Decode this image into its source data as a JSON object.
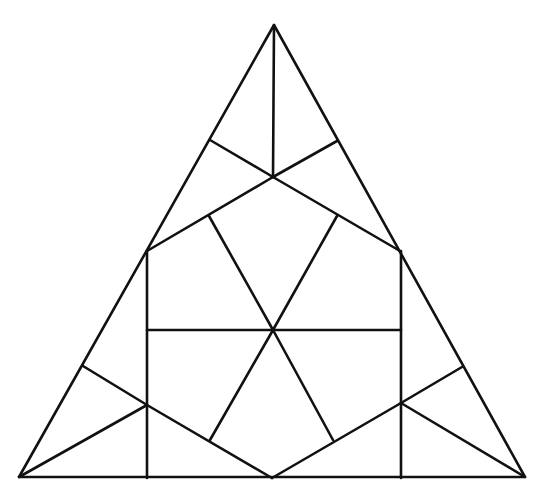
{
  "figure": {
    "stroke_color": "#111111",
    "background": "#ffffff",
    "stroke_width": 2.6,
    "outer_triangle": [
      [
        274,
        25
      ],
      [
        19,
        477
      ],
      [
        525,
        477
      ]
    ],
    "segments": [
      [
        274,
        25,
        273,
        177
      ],
      [
        210,
        140,
        273,
        177
      ],
      [
        337,
        141,
        273,
        177
      ],
      [
        273,
        177,
        147,
        251
      ],
      [
        273,
        177,
        400,
        251
      ],
      [
        209,
        216,
        273,
        330
      ],
      [
        337,
        216,
        273,
        330
      ],
      [
        147,
        251,
        147,
        478
      ],
      [
        401,
        251,
        401,
        478
      ],
      [
        147,
        330,
        401,
        330
      ],
      [
        273,
        330,
        210,
        440
      ],
      [
        273,
        330,
        333,
        440
      ],
      [
        19,
        477,
        147,
        405
      ],
      [
        83,
        366,
        147,
        405
      ],
      [
        147,
        405,
        272,
        478
      ],
      [
        272,
        478,
        401,
        403
      ],
      [
        401,
        403,
        462,
        367
      ],
      [
        401,
        403,
        525,
        477
      ]
    ]
  }
}
